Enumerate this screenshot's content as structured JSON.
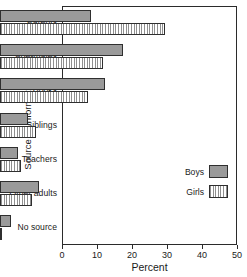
{
  "chart_data": {
    "type": "bar",
    "orientation": "horizontal",
    "title": "",
    "xlabel": "Percent",
    "ylabel": "Source of information",
    "xlim": [
      0,
      50
    ],
    "xticks": [
      0,
      10,
      20,
      30,
      40,
      50
    ],
    "grid": false,
    "legend_position": "inside-right-lower",
    "categories": [
      "Parents",
      "Age-mates",
      "Books",
      "Siblings",
      "Teachers",
      "Other adults",
      "No source"
    ],
    "series": [
      {
        "name": "Boys",
        "fill": "solid-gray",
        "color": "#9a9a9a",
        "values": [
          26,
          35,
          30,
          8,
          5,
          11,
          3
        ]
      },
      {
        "name": "Girls",
        "fill": "vertical-hatch",
        "color": "#ffffff",
        "values": [
          47,
          29.5,
          25,
          10.3,
          6,
          9,
          0.7
        ]
      }
    ]
  },
  "caption": "",
  "colors": {
    "axis": "#2b2b2b",
    "boys_fill": "#9a9a9a",
    "girls_hatch": "#8f8f8f",
    "background": "#ffffff"
  }
}
